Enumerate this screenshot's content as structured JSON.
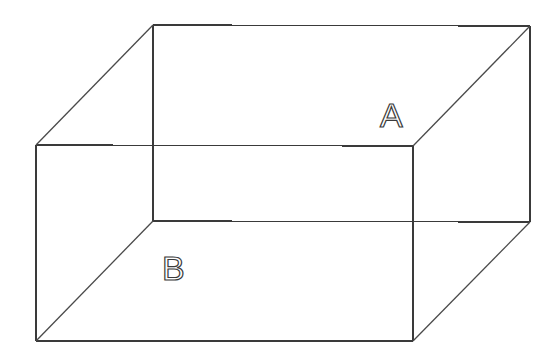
{
  "diagram": {
    "type": "wireframe-box",
    "colors": {
      "background": "#ffffff",
      "line": "#3a3a3a"
    },
    "back_face": {
      "tl": [
        153,
        25
      ],
      "tr": [
        530,
        26
      ],
      "br": [
        530,
        222
      ],
      "bl": [
        153,
        221
      ]
    },
    "front_face": {
      "tl": [
        36,
        145
      ],
      "tr": [
        413,
        146
      ],
      "br": [
        413,
        341
      ],
      "bl": [
        36,
        341
      ]
    },
    "labels": [
      {
        "id": "A",
        "text": "A",
        "x": 380,
        "y": 127
      },
      {
        "id": "B",
        "text": "B",
        "x": 162,
        "y": 280
      }
    ]
  }
}
